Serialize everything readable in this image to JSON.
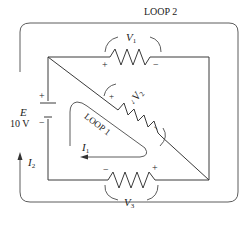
{
  "diagram": {
    "type": "circuit",
    "loops": [
      {
        "id": "loop2",
        "label": "LOOP 2",
        "current": "I",
        "current_sub": "2"
      },
      {
        "id": "loop1",
        "label": "LOOP 1",
        "current": "I",
        "current_sub": "1"
      }
    ],
    "source": {
      "symbol": "E",
      "value": "10 V",
      "plus": "+",
      "minus": "−"
    },
    "resistors": [
      {
        "id": "r1",
        "voltage": "V",
        "sub": "1",
        "plus": "+",
        "minus": "−"
      },
      {
        "id": "r2",
        "voltage": "V",
        "sub": "2",
        "plus": "+",
        "minus": "−"
      },
      {
        "id": "r3",
        "voltage": "V",
        "sub": "3",
        "plus": "+",
        "minus": "−"
      }
    ],
    "colors": {
      "line": "#3a3a3a",
      "background": "#ffffff"
    }
  }
}
